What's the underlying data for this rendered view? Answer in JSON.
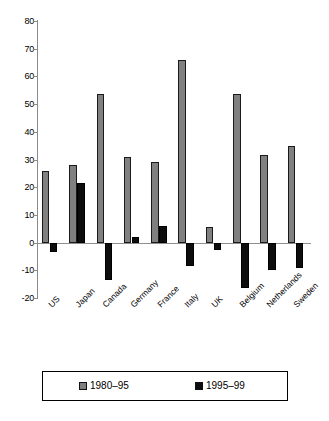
{
  "chart_data": {
    "type": "bar",
    "title": "",
    "subtitle": "",
    "xlabel": "",
    "ylabel": "",
    "ylim": [
      -20,
      80
    ],
    "ytick_step": 10,
    "yticks": [
      80,
      70,
      60,
      50,
      40,
      30,
      20,
      10,
      0,
      -10,
      -20
    ],
    "grid": false,
    "legend_position": "bottom",
    "categories": [
      "US",
      "Japan",
      "Canada",
      "Germany",
      "France",
      "Italy",
      "UK",
      "Belgium",
      "Netherlands",
      "Sweden"
    ],
    "series": [
      {
        "name": "1980–95",
        "color": "#808080",
        "values": [
          26,
          28,
          53.5,
          31,
          29,
          66,
          5.5,
          53.5,
          31.5,
          35
        ]
      },
      {
        "name": "1995–99",
        "color": "#0d0d0d",
        "values": [
          -3.5,
          21.5,
          -13.5,
          2,
          6,
          -8.5,
          -2.5,
          -16.5,
          -10,
          -9
        ]
      }
    ]
  },
  "legend": {
    "entries": [
      {
        "label": "1980–95",
        "swatch": "gray-swatch"
      },
      {
        "label": "1995–99",
        "swatch": "black-swatch"
      }
    ]
  },
  "axis": {
    "y_tick_labels": [
      "80",
      "70",
      "60",
      "50",
      "40",
      "30",
      "20",
      "10",
      "0",
      "-10",
      "-20"
    ]
  }
}
